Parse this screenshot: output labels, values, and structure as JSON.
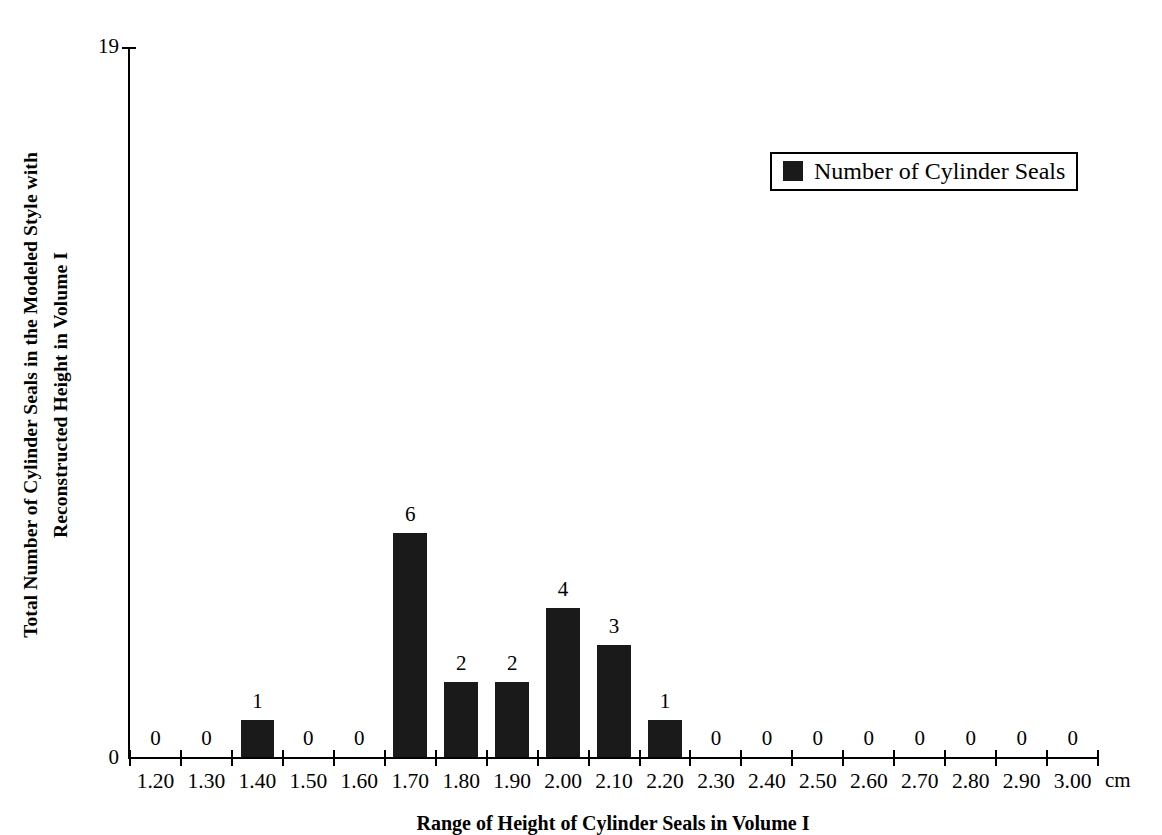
{
  "chart_data": {
    "type": "bar",
    "title": "",
    "xlabel": "Range of Height of Cylinder Seals in Volume I",
    "ylabel": "Total Number of Cylinder Seals in the Modeled Style with Reconstructed Height in Volume I",
    "x_unit": "cm",
    "categories": [
      "1.20",
      "1.30",
      "1.40",
      "1.50",
      "1.60",
      "1.70",
      "1.80",
      "1.90",
      "2.00",
      "2.10",
      "2.20",
      "2.30",
      "2.40",
      "2.50",
      "2.60",
      "2.70",
      "2.80",
      "2.90",
      "3.00"
    ],
    "values": [
      0,
      0,
      1,
      0,
      0,
      6,
      2,
      2,
      4,
      3,
      1,
      0,
      0,
      0,
      0,
      0,
      0,
      0,
      0
    ],
    "value_labels": [
      "0",
      "0",
      "1",
      "0",
      "0",
      "6",
      "2",
      "2",
      "4",
      "3",
      "1",
      "0",
      "0",
      "0",
      "0",
      "0",
      "0",
      "0",
      "0"
    ],
    "series": [
      {
        "name": "Number of Cylinder Seals",
        "values": [
          0,
          0,
          1,
          0,
          0,
          6,
          2,
          2,
          4,
          3,
          1,
          0,
          0,
          0,
          0,
          0,
          0,
          0,
          0
        ],
        "color": "#1a1a1a"
      }
    ],
    "ylim": [
      0,
      19
    ],
    "y_tick_labels": [
      "0",
      "19"
    ],
    "grid": false,
    "legend_position": "top-right",
    "bar_color": "#1a1a1a",
    "background_color": "#ffffff",
    "axis_color": "#000000"
  },
  "y_axis": {
    "title_line1": "Total Number of Cylinder Seals in the Modeled Style with",
    "title_line2": "Reconstructed Height in Volume I",
    "max_label": "19",
    "min_label": "0"
  },
  "x_axis": {
    "title": "Range of Height of Cylinder Seals in Volume I",
    "unit": "cm"
  },
  "legend": {
    "label": "Number of Cylinder Seals"
  }
}
